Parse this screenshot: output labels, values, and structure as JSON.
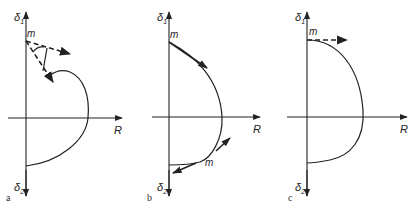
{
  "figure": {
    "panels": [
      {
        "id": "a",
        "caption": "a",
        "axis_top_label": "δ",
        "axis_top_sub": "1",
        "axis_bottom_label": "δ",
        "axis_bottom_sub": "2",
        "axis_right_label": "R",
        "point_labels": [
          "m"
        ]
      },
      {
        "id": "b",
        "caption": "b",
        "axis_top_label": "δ",
        "axis_top_sub": "1",
        "axis_bottom_label": "δ",
        "axis_bottom_sub": "2",
        "axis_right_label": "R",
        "point_labels": [
          "m",
          "m"
        ]
      },
      {
        "id": "c",
        "caption": "c",
        "axis_top_label": "δ",
        "axis_top_sub": "1",
        "axis_bottom_label": "δ",
        "axis_bottom_sub": "2",
        "axis_right_label": "R",
        "point_labels": [
          "m"
        ]
      }
    ],
    "colors": {
      "ink": "#222222",
      "background": "#ffffff"
    }
  }
}
